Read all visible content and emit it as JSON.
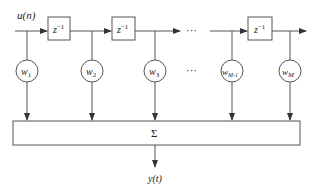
{
  "diagram": {
    "type": "transversal-filter",
    "input_label": "u(n)",
    "output_label": "y(t)",
    "delay_label_base": "z",
    "delay_label_exp": "−1",
    "sum_label": "Σ",
    "ellipsis": "···",
    "weights": [
      {
        "base": "w",
        "sub": "1"
      },
      {
        "base": "w",
        "sub": "2"
      },
      {
        "base": "w",
        "sub": "3"
      },
      {
        "base": "w",
        "sub": "M-1"
      },
      {
        "base": "w",
        "sub": "M"
      }
    ],
    "colors": {
      "stroke": "#555555",
      "text": "#222222",
      "background": "#ffffff"
    }
  }
}
